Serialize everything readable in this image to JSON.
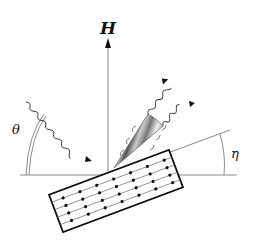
{
  "diagram": {
    "labels": {
      "field": "H",
      "theta": "θ",
      "eta": "η"
    },
    "colors": {
      "line": "#8a8a8a",
      "ink": "#111111",
      "background": "#ffffff"
    },
    "elements": {
      "field_arrow": "vertical magnetic field vector H",
      "baseline": "horizontal reference line",
      "tilt_line": "sample surface tilt line at angle eta",
      "sample": "tilted rectangular crystal lattice with dots",
      "incident_wave": "incoming wavy beam at angle theta",
      "cone": "striped emission cone with two outgoing wavy beams"
    }
  }
}
